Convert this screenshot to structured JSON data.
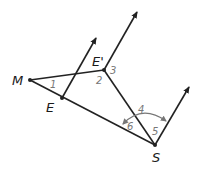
{
  "diagram": {
    "colors": {
      "line": "#222222",
      "angle_label": "#777777",
      "arc": "#777777",
      "background": "#ffffff"
    },
    "points": [
      {
        "name": "M",
        "label": "M"
      },
      {
        "name": "E",
        "label": "E"
      },
      {
        "name": "E_prime",
        "label": "E'"
      },
      {
        "name": "S",
        "label": "S"
      }
    ],
    "angles": [
      {
        "id": "1",
        "label": "1"
      },
      {
        "id": "2",
        "label": "2"
      },
      {
        "id": "3",
        "label": "3"
      },
      {
        "id": "4",
        "label": "4"
      },
      {
        "id": "5",
        "label": "5"
      },
      {
        "id": "6",
        "label": "6"
      }
    ],
    "segments": [
      "ME",
      "MS",
      "ME'",
      "E'S"
    ],
    "rays": [
      "from E (parallel)",
      "from E' (parallel)",
      "from S (parallel)"
    ]
  }
}
